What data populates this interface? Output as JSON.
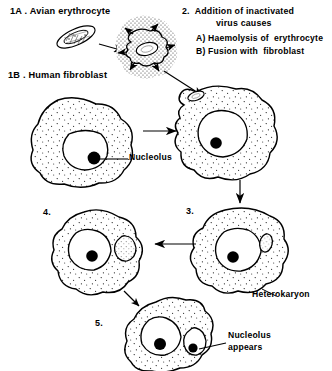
{
  "figure": {
    "background_color": "#ffffff",
    "ink_color": "#000000",
    "width": 332,
    "height": 371
  },
  "labels": {
    "step_1a": "1A . Avian erythrocyte",
    "step_1b": "1B . Human fibroblast",
    "step_2_line1": "2.  Addition of inactivated",
    "step_2_line2": "virus causes",
    "step_2_a": "A) Haemolysis of  erythrocyte",
    "step_2_b": "B) Fusion with  fibroblast",
    "panel_3": "3.",
    "panel_4": "4.",
    "panel_5": "5.",
    "nucleolus": "Nucleolus",
    "heterokaryon": "Heterokaryon",
    "nucleolus_appears_line1": "Nucleolus",
    "nucleolus_appears_line2": "appears"
  },
  "diagram": {
    "erythrocyte": {
      "name": "avian-erythrocyte",
      "shape": "elongated-ellipse",
      "description": "small elongated nucleated red blood cell, tilted"
    },
    "virus_cloud": {
      "name": "virus-cloud",
      "shape": "stippled-halo",
      "description": "dotted halo of inactivated virus surrounding a lysing erythrocyte with radiating arrows"
    },
    "fibroblast": {
      "name": "human-fibroblast",
      "description": "large irregular stippled cell with round nucleus and dark nucleolus"
    },
    "panels": [
      {
        "id": "fusion",
        "number": "",
        "description": "fibroblast with erythrocyte nucleus entering at the upper left, large nucleus with nucleolus"
      },
      {
        "id": "heterokaryon",
        "number": "3.",
        "description": "heterokaryon: large fibroblast nucleus with dark nucleolus plus small condensed erythrocyte nucleus"
      },
      {
        "id": "swelling",
        "number": "4.",
        "description": "erythrocyte nucleus swells and becomes paler, no nucleolus yet"
      },
      {
        "id": "reactivated",
        "number": "5.",
        "description": "both nuclei enlarged, each containing a dark nucleolus"
      }
    ],
    "arrows": [
      {
        "name": "arrow-erythrocyte-to-virus",
        "direction": "right"
      },
      {
        "name": "arrow-virus-to-fusion",
        "direction": "down-right"
      },
      {
        "name": "arrow-fibroblast-to-fusion",
        "direction": "right"
      },
      {
        "name": "arrow-fusion-to-heterokaryon",
        "direction": "down"
      },
      {
        "name": "arrow-heterokaryon-to-swelling",
        "direction": "left"
      },
      {
        "name": "arrow-swelling-to-reactivated",
        "direction": "down-left"
      }
    ]
  }
}
